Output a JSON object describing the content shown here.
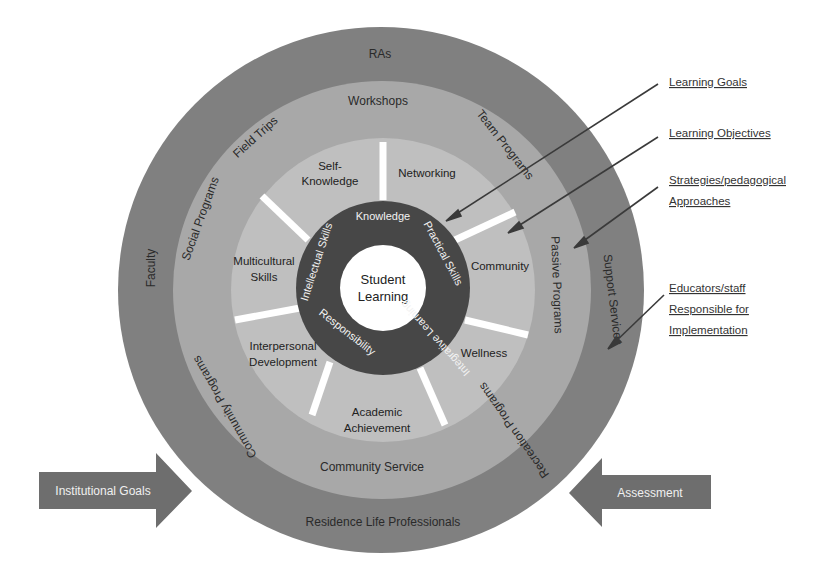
{
  "diagram": {
    "center": {
      "label_line1": "Student",
      "label_line2": "Learning"
    },
    "core_ring": {
      "labels": [
        "Knowledge",
        "Practical Skills",
        "Integrative Learning",
        "Responsibility",
        "Intellectual Skills"
      ]
    },
    "outcomes_ring": {
      "labels": {
        "self_knowledge_1": "Self-",
        "self_knowledge_2": "Knowledge",
        "networking": "Networking",
        "community": "Community",
        "wellness": "Wellness",
        "academic_1": "Academic",
        "academic_2": "Achievement",
        "interpersonal_1": "Interpersonal",
        "interpersonal_2": "Development",
        "multicultural_1": "Multicultural",
        "multicultural_2": "Skills"
      }
    },
    "programs_ring": {
      "labels": {
        "workshops": "Workshops",
        "team_programs": "Team Programs",
        "passive_programs": "Passive Programs",
        "recreation_programs": "Recreation Programs",
        "community_service": "Community Service",
        "community_programs": "Community Programs",
        "social_programs": "Social Programs",
        "field_trips": "Field Trips"
      }
    },
    "staff_ring": {
      "labels": {
        "ras": "RAs",
        "support_services": "Support Services",
        "residence_life": "Residence Life Professionals",
        "faculty": "Faculty"
      }
    },
    "legend": {
      "learning_goals": "Learning Goals",
      "learning_objectives": "Learning Objectives",
      "strategies_1": "Strategies/pedagogical",
      "strategies_2": "Approaches",
      "educators_1": "Educators/staff",
      "educators_2": "Responsible for",
      "educators_3": "Implementation"
    },
    "arrows": {
      "left": "Institutional Goals",
      "right": "Assessment"
    },
    "colors": {
      "staff_ring": "#7f7f7f",
      "programs_ring": "#a6a6a6",
      "outcomes_ring": "#bdbdbd",
      "core_ring": "#4a4a4a",
      "center": "#ffffff",
      "arrow": "#6e6e6e",
      "spoke": "#ffffff"
    }
  }
}
